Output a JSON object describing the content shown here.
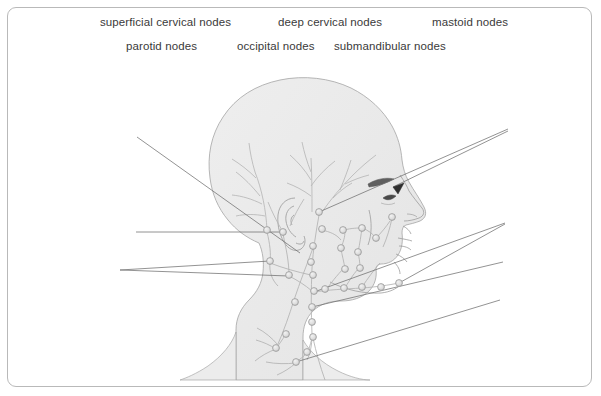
{
  "figure": {
    "background_color": "#ffffff",
    "frame_color": "#b9b9b9",
    "label_color": "#3a3a3a"
  },
  "labels": {
    "superficial_cervical": "superficial cervical nodes",
    "deep_cervical": "deep cervical nodes",
    "mastoid": "mastoid nodes",
    "parotid": "parotid nodes",
    "occipital": "occipital nodes",
    "submandibular": "submandibular nodes"
  },
  "artwork": {
    "subject": "lateral view of human head and neck",
    "orientation": "facing right",
    "skin_fill": "#ececec",
    "outline_color": "#9a9a9a",
    "vessel_color": "#b0b0b0",
    "node_fill": "#dcdcdc",
    "node_stroke": "#9b9b9b",
    "leader_line_color": "#6d6d6d",
    "eyebrow_color": "#5a5a5a",
    "node_radius": 3.4,
    "node_count": 31
  },
  "nodes": [
    {
      "id": "occipital-upper",
      "x": 267,
      "y": 230
    },
    {
      "id": "occipital-lower",
      "x": 283,
      "y": 232
    },
    {
      "id": "mastoid-a",
      "x": 319,
      "y": 212
    },
    {
      "id": "mastoid-b",
      "x": 322,
      "y": 229
    },
    {
      "id": "mastoid-c",
      "x": 313,
      "y": 246
    },
    {
      "id": "posterior-cervical-1",
      "x": 270,
      "y": 261
    },
    {
      "id": "posterior-cervical-2",
      "x": 289,
      "y": 275
    },
    {
      "id": "deep-cervical-1",
      "x": 311,
      "y": 262
    },
    {
      "id": "deep-cervical-2",
      "x": 313,
      "y": 275
    },
    {
      "id": "deep-cervical-3",
      "x": 314,
      "y": 291
    },
    {
      "id": "deep-cervical-4",
      "x": 312,
      "y": 307
    },
    {
      "id": "deep-cervical-5",
      "x": 312,
      "y": 322
    },
    {
      "id": "deep-cervical-6",
      "x": 313,
      "y": 337
    },
    {
      "id": "supraclavicular-1",
      "x": 307,
      "y": 352
    },
    {
      "id": "supraclavicular-2",
      "x": 296,
      "y": 362
    },
    {
      "id": "jugular-chain-1",
      "x": 295,
      "y": 302
    },
    {
      "id": "jugular-chain-2",
      "x": 286,
      "y": 334
    },
    {
      "id": "jugular-chain-3",
      "x": 276,
      "y": 348
    },
    {
      "id": "facial-1",
      "x": 341,
      "y": 248
    },
    {
      "id": "facial-2",
      "x": 358,
      "y": 252
    },
    {
      "id": "facial-3",
      "x": 345,
      "y": 269
    },
    {
      "id": "facial-4",
      "x": 360,
      "y": 268
    },
    {
      "id": "buccal-1",
      "x": 343,
      "y": 230
    },
    {
      "id": "buccal-2",
      "x": 362,
      "y": 228
    },
    {
      "id": "buccal-3",
      "x": 376,
      "y": 238
    },
    {
      "id": "submandibular-1",
      "x": 325,
      "y": 289
    },
    {
      "id": "submandibular-2",
      "x": 344,
      "y": 288
    },
    {
      "id": "submandibular-3",
      "x": 362,
      "y": 287
    },
    {
      "id": "submandibular-4",
      "x": 381,
      "y": 287
    },
    {
      "id": "submental",
      "x": 399,
      "y": 283
    },
    {
      "id": "preauricular",
      "x": 392,
      "y": 217
    }
  ],
  "leader_lines": [
    {
      "id": "leader-superficial",
      "from": [
        137,
        137
      ],
      "to": [
        300,
        253
      ]
    },
    {
      "id": "leader-parotid-upper",
      "from": [
        136,
        232
      ],
      "to": [
        283,
        232
      ]
    },
    {
      "id": "leader-parotid-lower",
      "from": [
        120,
        270
      ],
      "to": [
        270,
        261
      ]
    },
    {
      "id": "leader-occipital",
      "from": [
        120,
        270
      ],
      "to": [
        289,
        275
      ]
    },
    {
      "id": "leader-mastoid",
      "from": [
        508,
        129
      ],
      "to": [
        319,
        212
      ]
    },
    {
      "id": "leader-deep-upper",
      "from": [
        508,
        131
      ],
      "to": [
        392,
        186
      ]
    },
    {
      "id": "leader-submandibular-a",
      "from": [
        505,
        223
      ],
      "to": [
        314,
        291
      ]
    },
    {
      "id": "leader-submandibular-b",
      "from": [
        505,
        224
      ],
      "to": [
        399,
        283
      ]
    },
    {
      "id": "leader-lower-chain",
      "from": [
        503,
        262
      ],
      "to": [
        312,
        307
      ]
    },
    {
      "id": "leader-supraclavicular",
      "from": [
        500,
        300
      ],
      "to": [
        296,
        362
      ]
    }
  ]
}
